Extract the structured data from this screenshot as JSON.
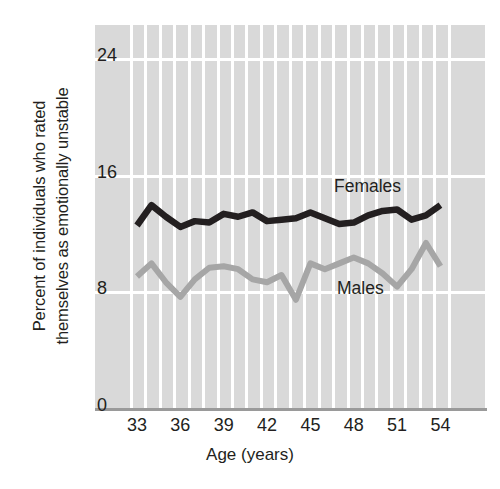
{
  "axes": {
    "ylabel_line1": "Percent of individuals who rated",
    "ylabel_line2": "themselves as emotionally unstable",
    "xlabel": "Age (years)",
    "yticks": [
      "0",
      "8",
      "16",
      "24"
    ],
    "xticks": [
      "33",
      "36",
      "39",
      "42",
      "45",
      "48",
      "51",
      "54"
    ]
  },
  "legend": {
    "females_label": "Females",
    "males_label": "Males"
  },
  "colors": {
    "plot_background": "#d9d9d9",
    "gridline": "#ffffff",
    "axis": "#9a9a9a",
    "females_line": "#231f20",
    "males_line": "#a6a6a6",
    "text": "#231f20"
  },
  "chart_data": {
    "type": "line",
    "title": "",
    "xlabel": "Age (years)",
    "ylabel": "Percent of individuals who rated themselves as emotionally unstable",
    "xlim": [
      32,
      55
    ],
    "ylim": [
      0,
      26
    ],
    "yticks": [
      0,
      8,
      16,
      24
    ],
    "xticks": [
      33,
      36,
      39,
      42,
      45,
      48,
      51,
      54
    ],
    "grid": true,
    "legend_position": "inline-annotation",
    "x": [
      33,
      34,
      35,
      36,
      37,
      38,
      39,
      40,
      41,
      42,
      43,
      44,
      45,
      46,
      47,
      48,
      49,
      50,
      51,
      52,
      53,
      54
    ],
    "series": [
      {
        "name": "Females",
        "color": "#231f20",
        "values": [
          12.5,
          13.9,
          13.1,
          12.4,
          12.8,
          12.7,
          13.3,
          13.1,
          13.4,
          12.8,
          12.9,
          13.0,
          13.4,
          13.0,
          12.6,
          12.7,
          13.2,
          13.5,
          13.6,
          12.9,
          13.2,
          13.9
        ]
      },
      {
        "name": "Males",
        "color": "#a6a6a6",
        "values": [
          9.0,
          9.9,
          8.6,
          7.6,
          8.8,
          9.6,
          9.7,
          9.5,
          8.8,
          8.6,
          9.1,
          7.4,
          9.9,
          9.5,
          9.9,
          10.3,
          9.9,
          9.2,
          8.3,
          9.5,
          11.3,
          9.7
        ]
      }
    ]
  }
}
